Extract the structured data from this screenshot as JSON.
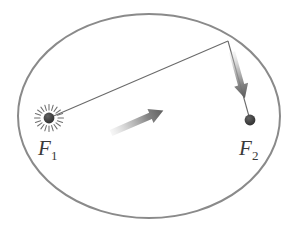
{
  "figure": {
    "background_color": "#ffffff",
    "width": 299,
    "height": 229
  },
  "ellipse": {
    "name": "orbit-ellipse",
    "center_x": 149,
    "center_y": 116,
    "radius_x": 131,
    "radius_y": 102,
    "stroke_color": "#8a8a8a",
    "stroke_width": 2,
    "fill": "none"
  },
  "foci": [
    {
      "id": "F1",
      "label": "F",
      "subscript": "1",
      "x": 49,
      "y": 118,
      "label_x": 38,
      "label_y": 152,
      "dot_radius": 5,
      "dot_color": "#3d3d3d",
      "has_starburst": true,
      "starburst_rays": 20,
      "starburst_color": "#6f6f6f"
    },
    {
      "id": "F2",
      "label": "F",
      "subscript": "2",
      "x": 250,
      "y": 120,
      "label_x": 239,
      "label_y": 152,
      "dot_radius": 5,
      "dot_color": "#3d3d3d",
      "has_starburst": false
    }
  ],
  "vertex": {
    "name": "orbit-point",
    "x": 228,
    "y": 41
  },
  "vectors": [
    {
      "id": "radius-vector-f1",
      "from_x": 49,
      "from_y": 118,
      "to_x": 228,
      "to_y": 41,
      "line_color": "#6a6a6a",
      "line_width": 1,
      "arrow_start_fraction": 0.35,
      "arrow_end_fraction": 0.63,
      "arrow_color": "#7e7e7e",
      "arrow_gradient": true
    },
    {
      "id": "radius-vector-f2",
      "from_x": 228,
      "from_y": 41,
      "to_x": 250,
      "to_y": 120,
      "line_color": "#6a6a6a",
      "line_width": 1,
      "arrow_start_fraction": 0.18,
      "arrow_end_fraction": 0.76,
      "arrow_color": "#7e7e7e",
      "arrow_gradient": true
    }
  ],
  "labels": {
    "f1_text": "F",
    "f1_sub": "1",
    "f2_text": "F",
    "f2_sub": "2"
  },
  "colors": {
    "ellipse_stroke": "#8a8a8a",
    "line_stroke": "#6a6a6a",
    "dot_fill": "#3d3d3d",
    "arrow_fill": "#7e7e7e",
    "text_fill": "#3a3a3a",
    "background": "#ffffff"
  }
}
